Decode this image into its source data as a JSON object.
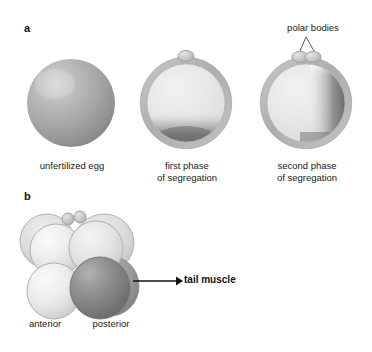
{
  "figure": {
    "background_color": "#ffffff"
  },
  "panels": [
    {
      "id": "a",
      "label": "a",
      "annotation": {
        "name": "polar-bodies",
        "text": "polar bodies"
      },
      "stages": [
        {
          "name": "unfertilized-egg",
          "caption": "unfertilized egg",
          "cx": 71,
          "cy": 103,
          "r": 44,
          "membrane": false,
          "polar_bodies": 0,
          "cytoplasm": "uniform",
          "fill_color": "#a8a8a8",
          "highlight_color": "#d8d8d8",
          "shadow_color": "#7b7b7b"
        },
        {
          "name": "first-phase-segregation",
          "caption": "first phase\nof segregation",
          "cx": 186,
          "cy": 103,
          "r": 44,
          "membrane": true,
          "polar_bodies": 1,
          "cytoplasm": "vegetal-pole-crescent",
          "fill_color": "#e2e2e2",
          "membrane_color": "#b4b4b4",
          "dark_region_color": "#6f6f6f"
        },
        {
          "name": "second-phase-segregation",
          "caption": "second phase\nof segregation",
          "cx": 306,
          "cy": 103,
          "r": 44,
          "membrane": true,
          "polar_bodies": 2,
          "cytoplasm": "posterior-right-crescent",
          "fill_color": "#e2e2e2",
          "membrane_color": "#b4b4b4",
          "dark_region_color": "#6f6f6f"
        }
      ]
    },
    {
      "id": "b",
      "label": "b",
      "embryo": {
        "name": "eight-cell-embryo",
        "polar_bodies": 2,
        "cells": [
          {
            "name": "anterior-upper-left",
            "tone": "light",
            "fill_color": "#e8e8e8"
          },
          {
            "name": "anterior-upper-right",
            "tone": "light",
            "fill_color": "#e4e4e4"
          },
          {
            "name": "anterior-lower-left",
            "tone": "light",
            "fill_color": "#ececec"
          },
          {
            "name": "posterior-dark-cell",
            "tone": "dark",
            "fill_color": "#8a8a8a"
          },
          {
            "name": "background-cell-left",
            "tone": "light",
            "fill_color": "#dcdcdc"
          },
          {
            "name": "background-cell-right",
            "tone": "light",
            "fill_color": "#d6d6d6"
          },
          {
            "name": "background-cell-back",
            "tone": "dark",
            "fill_color": "#9a9a9a"
          }
        ],
        "axis_labels": {
          "anterior": "anterior",
          "posterior": "posterior"
        },
        "callout": {
          "name": "tail-muscle",
          "text": "tail muscle",
          "arrow_from_x": 160,
          "arrow_to_x": 180,
          "arrow_y": 281
        }
      }
    }
  ]
}
